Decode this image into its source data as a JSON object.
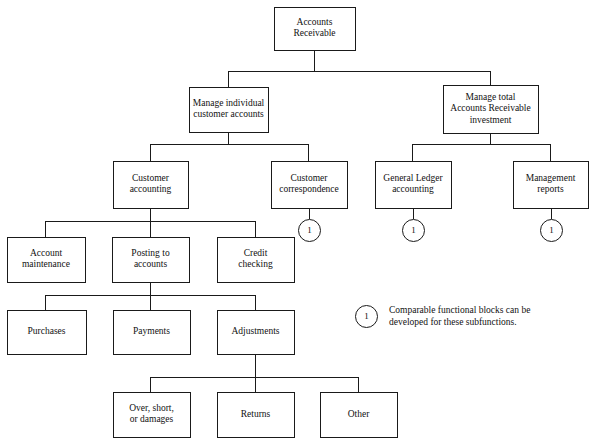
{
  "diagram": {
    "type": "functional-decomposition-tree",
    "title_text": "Accounts Receivable",
    "background_color": "#ffffff",
    "line_color": "#1a1a1a",
    "text_color": "#111111",
    "nodes": [
      {
        "id": "accounts-receivable",
        "lines": [
          "Accounts",
          "Receivable"
        ],
        "x": 274,
        "y": 7,
        "w": 81,
        "h": 43,
        "level": 1
      },
      {
        "id": "manage-individual-customer-accounts",
        "lines": [
          "Manage individual",
          "customer accounts"
        ],
        "x": 189,
        "y": 87,
        "w": 79,
        "h": 45,
        "level": 2
      },
      {
        "id": "manage-total-ar-investment",
        "lines": [
          "Manage total",
          "Accounts Receivable",
          "investment"
        ],
        "x": 443,
        "y": 85,
        "w": 95,
        "h": 48,
        "level": 2
      },
      {
        "id": "customer-accounting",
        "lines": [
          "Customer",
          "accounting"
        ],
        "x": 113,
        "y": 161,
        "w": 75,
        "h": 47,
        "level": 3
      },
      {
        "id": "customer-correspondence",
        "lines": [
          "Customer",
          "correspondence"
        ],
        "x": 271,
        "y": 161,
        "w": 76,
        "h": 47,
        "level": 3
      },
      {
        "id": "general-ledger-accounting",
        "lines": [
          "General Ledger",
          "accounting"
        ],
        "x": 375,
        "y": 161,
        "w": 76,
        "h": 47,
        "level": 3
      },
      {
        "id": "management-reports",
        "lines": [
          "Management",
          "reports"
        ],
        "x": 513,
        "y": 161,
        "w": 75,
        "h": 47,
        "level": 3
      },
      {
        "id": "account-maintenance",
        "lines": [
          "Account",
          "maintenance"
        ],
        "x": 7,
        "y": 237,
        "w": 78,
        "h": 45,
        "level": 4
      },
      {
        "id": "posting-to-accounts",
        "lines": [
          "Posting to",
          "accounts"
        ],
        "x": 112,
        "y": 237,
        "w": 77,
        "h": 45,
        "level": 4
      },
      {
        "id": "credit-checking",
        "lines": [
          "Credit",
          "checking"
        ],
        "x": 217,
        "y": 237,
        "w": 77,
        "h": 45,
        "level": 4
      },
      {
        "id": "purchases",
        "lines": [
          "Purchases"
        ],
        "x": 7,
        "y": 310,
        "w": 79,
        "h": 44,
        "level": 5
      },
      {
        "id": "payments",
        "lines": [
          "Payments"
        ],
        "x": 113,
        "y": 310,
        "w": 77,
        "h": 44,
        "level": 5
      },
      {
        "id": "adjustments",
        "lines": [
          "Adjustments"
        ],
        "x": 217,
        "y": 310,
        "w": 77,
        "h": 44,
        "level": 5
      },
      {
        "id": "over-short-or-damages",
        "lines": [
          "Over, short,",
          "or damages"
        ],
        "x": 113,
        "y": 392,
        "w": 77,
        "h": 45,
        "level": 6
      },
      {
        "id": "returns",
        "lines": [
          "Returns"
        ],
        "x": 217,
        "y": 392,
        "w": 77,
        "h": 45,
        "level": 6
      },
      {
        "id": "other",
        "lines": [
          "Other"
        ],
        "x": 320,
        "y": 392,
        "w": 77,
        "h": 45,
        "level": 6
      }
    ],
    "markers": [
      {
        "id": "marker-customer-correspondence",
        "label": "1",
        "cx": 309,
        "cy": 230,
        "r": 11,
        "stem_from": 208,
        "stem_to": 219
      },
      {
        "id": "marker-general-ledger-accounting",
        "label": "1",
        "cx": 413,
        "cy": 230,
        "r": 11,
        "stem_from": 208,
        "stem_to": 219
      },
      {
        "id": "marker-management-reports",
        "label": "1",
        "cx": 551,
        "cy": 230,
        "r": 11,
        "stem_from": 208,
        "stem_to": 219
      }
    ],
    "connectors": [
      {
        "id": "root-stem-down",
        "d": "M 314.5 50 L 314.5 71"
      },
      {
        "id": "root-bus",
        "d": "M 228.5 71 L 490.5 71"
      },
      {
        "id": "root-to-left-child",
        "d": "M 228.5 71 L 228.5 87"
      },
      {
        "id": "root-to-right-child",
        "d": "M 490.5 71 L 490.5 85"
      },
      {
        "id": "left-l2-stem-down",
        "d": "M 228.5 132 L 228.5 144"
      },
      {
        "id": "left-l2-bus",
        "d": "M 150.5 144 L 308.5 144"
      },
      {
        "id": "left-l2-to-customer-accounting",
        "d": "M 150.5 144 L 150.5 161"
      },
      {
        "id": "left-l2-to-customer-correspondence",
        "d": "M 308.5 144 L 308.5 161"
      },
      {
        "id": "right-l2-stem-down",
        "d": "M 490.5 133 L 490.5 144"
      },
      {
        "id": "right-l2-bus",
        "d": "M 412.5 144 L 550.5 144"
      },
      {
        "id": "right-l2-to-general-ledger",
        "d": "M 412.5 144 L 412.5 161"
      },
      {
        "id": "right-l2-to-management-reports",
        "d": "M 550.5 144 L 550.5 161"
      },
      {
        "id": "customer-accounting-stem-down",
        "d": "M 150.5 208 L 150.5 221"
      },
      {
        "id": "customer-accounting-bus",
        "d": "M 45.5 221 L 255.5 221"
      },
      {
        "id": "ca-to-account-maintenance",
        "d": "M 45.5 221 L 45.5 237"
      },
      {
        "id": "ca-to-posting-to-accounts",
        "d": "M 150.5 221 L 150.5 237"
      },
      {
        "id": "ca-to-credit-checking",
        "d": "M 255.5 221 L 255.5 237"
      },
      {
        "id": "posting-stem-down",
        "d": "M 150.5 282 L 150.5 295"
      },
      {
        "id": "posting-bus",
        "d": "M 45.5 295 L 255.5 295"
      },
      {
        "id": "posting-to-purchases",
        "d": "M 45.5 295 L 45.5 310"
      },
      {
        "id": "posting-to-payments",
        "d": "M 150.5 295 L 150.5 310"
      },
      {
        "id": "posting-to-adjustments",
        "d": "M 255.5 295 L 255.5 310"
      },
      {
        "id": "adjustments-stem-down",
        "d": "M 255.5 354 L 255.5 377"
      },
      {
        "id": "adjustments-bus",
        "d": "M 150.5 377 L 358.5 377"
      },
      {
        "id": "adj-to-over-short",
        "d": "M 150.5 377 L 150.5 392"
      },
      {
        "id": "adj-to-returns",
        "d": "M 255.5 377 L 255.5 392"
      },
      {
        "id": "adj-to-other",
        "d": "M 358.5 377 L 358.5 392"
      }
    ],
    "legend": {
      "marker_label": "1",
      "cx": 366,
      "cy": 316,
      "r": 11,
      "text_x": 389,
      "lines": [
        "Comparable functional blocks can be",
        "developed for these subfunctions."
      ]
    }
  }
}
